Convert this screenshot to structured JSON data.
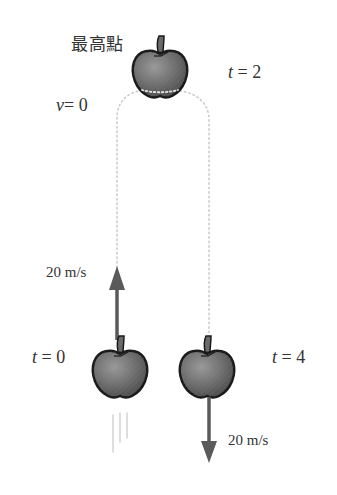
{
  "diagram": {
    "title_label": "最高點",
    "apex": {
      "time_var": "t",
      "time_value": "2",
      "velocity_var": "v",
      "velocity_value": "0"
    },
    "launch": {
      "time_var": "t",
      "time_value": "0",
      "speed_label": "20 m/s",
      "direction": "up"
    },
    "landing": {
      "time_var": "t",
      "time_value": "4",
      "speed_label": "20 m/s",
      "direction": "down"
    },
    "icons": [
      "apple-icon",
      "arrow-up-icon",
      "arrow-down-icon",
      "motion-lines-icon",
      "dotted-trajectory"
    ],
    "colors": {
      "apple_fill": "#6f6f6f",
      "apple_outline": "#1a1a1a",
      "arrow": "#5a5a5a",
      "trajectory": "#c8c8c8",
      "text": "#333333"
    }
  }
}
